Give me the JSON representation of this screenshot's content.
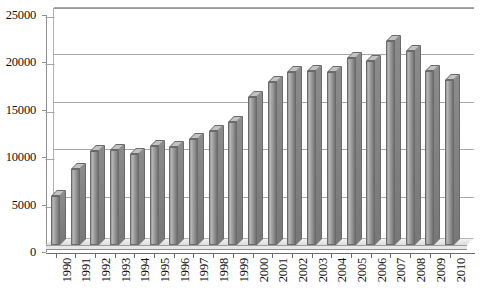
{
  "chart_data": {
    "type": "bar",
    "title": "",
    "subtitle": "",
    "xlabel": "",
    "ylabel": "",
    "categories": [
      "1990",
      "1991",
      "1992",
      "1993",
      "1994",
      "1995",
      "1996",
      "1997",
      "1998",
      "1999",
      "2000",
      "2001",
      "2002",
      "2003",
      "2004",
      "2005",
      "2006",
      "2007",
      "2008",
      "2009",
      "2010"
    ],
    "values": [
      5200,
      8000,
      9900,
      10000,
      9600,
      10400,
      10300,
      11200,
      12000,
      13000,
      15600,
      17200,
      18200,
      18400,
      18200,
      19700,
      19400,
      21500,
      20500,
      18400,
      17400
    ],
    "series": [
      {
        "name": "",
        "values": [
          5200,
          8000,
          9900,
          10000,
          9600,
          10400,
          10300,
          11200,
          12000,
          13000,
          15600,
          17200,
          18200,
          18400,
          18200,
          19700,
          19400,
          21500,
          20500,
          18400,
          17400
        ]
      }
    ],
    "ylim": [
      0,
      25000
    ],
    "yticks": [
      0,
      5000,
      10000,
      15000,
      20000,
      25000
    ],
    "ytick_labels": [
      "0",
      "5000",
      "10000",
      "15000",
      "20000",
      "25000"
    ],
    "xtick_labels": [
      "1990",
      "1991",
      "1992",
      "1993",
      "1994",
      "1995",
      "1996",
      "1997",
      "1998",
      "1999",
      "2000",
      "2001",
      "2002",
      "2003",
      "2004",
      "2005",
      "2006",
      "2007",
      "2008",
      "2009",
      "2010"
    ],
    "xtick_rotation": -90,
    "grid": true,
    "grid_axis": "y",
    "legend": false,
    "legend_position": "none",
    "style": "3d-column",
    "colors": {
      "bar_fill": "#a3a3a3",
      "bar_highlight": "#b9b9b9",
      "bar_shadow": "#6f6f6f",
      "bar_outline": "#6a6a6a",
      "gridline": "#a6a6a6",
      "axis": "#6e6e6e",
      "background": "#ffffff",
      "text": "#101010"
    }
  }
}
